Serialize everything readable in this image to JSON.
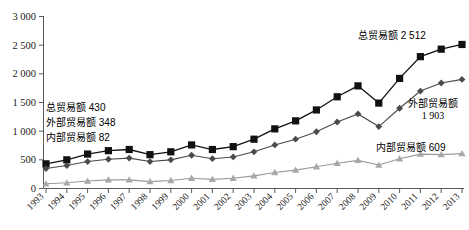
{
  "chart_data": {
    "type": "line",
    "title": "",
    "xlabel": "",
    "ylabel": "",
    "ylim": [
      0,
      3000
    ],
    "yticks": [
      0,
      500,
      1000,
      1500,
      2000,
      2500,
      3000
    ],
    "ytick_labels": [
      "0",
      "500",
      "1 000",
      "1 500",
      "2 000",
      "2 500",
      "3 000"
    ],
    "grid": false,
    "legend_position": "none",
    "x": [
      1993,
      1994,
      1995,
      1996,
      1997,
      1998,
      1999,
      2000,
      2001,
      2002,
      2003,
      2004,
      2005,
      2006,
      2007,
      2008,
      2009,
      2010,
      2011,
      2012,
      2013
    ],
    "categories": [
      "1993",
      "1994",
      "1995",
      "1996",
      "1997",
      "1998",
      "1999",
      "2000",
      "2001",
      "2002",
      "2003",
      "2004",
      "2005",
      "2006",
      "2007",
      "2008",
      "2009",
      "2010",
      "2011",
      "2012",
      "2013"
    ],
    "series": [
      {
        "name": "总贸易额",
        "marker": "square",
        "color": "#111111",
        "values": [
          430,
          500,
          600,
          660,
          680,
          590,
          640,
          760,
          680,
          730,
          860,
          1040,
          1180,
          1370,
          1600,
          1790,
          1490,
          1920,
          2300,
          2430,
          2512
        ]
      },
      {
        "name": "外部贸易额",
        "marker": "diamond",
        "color": "#4a4a4a",
        "values": [
          348,
          400,
          470,
          510,
          530,
          470,
          500,
          580,
          520,
          550,
          640,
          760,
          860,
          990,
          1160,
          1300,
          1080,
          1400,
          1700,
          1840,
          1903
        ]
      },
      {
        "name": "内部贸易额",
        "marker": "triangle",
        "color": "#a8a8a8",
        "values": [
          82,
          100,
          130,
          150,
          150,
          120,
          140,
          180,
          160,
          180,
          220,
          280,
          320,
          380,
          440,
          490,
          410,
          520,
          600,
          590,
          609
        ]
      }
    ],
    "annotations": [
      {
        "id": "total-start",
        "text_label": "总贸易额",
        "text_value": "430"
      },
      {
        "id": "external-start",
        "text_label": "外部贸易额",
        "text_value": "348"
      },
      {
        "id": "internal-start",
        "text_label": "内部贸易额",
        "text_value": "82"
      },
      {
        "id": "total-end",
        "text_label": "总贸易额",
        "text_value": "2 512"
      },
      {
        "id": "external-end",
        "text_label": "外部贸易额",
        "text_value": "1 903"
      },
      {
        "id": "internal-end",
        "text_label": "内部贸易额",
        "text_value": "609"
      }
    ]
  },
  "annotations": {
    "total_start": "总贸易额 430",
    "external_start": "外部贸易额 348",
    "internal_start": "内部贸易额 82",
    "total_end": "总贸易额 2 512",
    "external_end_label": "外部贸易额",
    "external_end_value": "1 903",
    "internal_end": "内部贸易额 609"
  },
  "colors": {
    "total": "#111111",
    "external": "#4a4a4a",
    "internal": "#a8a8a8",
    "axis": "#5a5a5a",
    "background": "#ffffff"
  }
}
